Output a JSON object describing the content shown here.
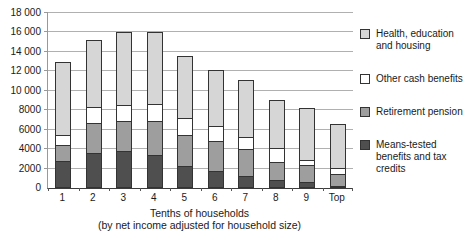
{
  "chart_data": {
    "type": "bar",
    "stacked": true,
    "grid": true,
    "legend_position": "right",
    "categories": [
      "1",
      "2",
      "3",
      "4",
      "5",
      "6",
      "7",
      "8",
      "9",
      "Top"
    ],
    "series": [
      {
        "name": "Means-tested benefits and tax credits",
        "color": "#4f4f4f",
        "values": [
          2800,
          3600,
          3800,
          3400,
          2300,
          1700,
          1200,
          800,
          600,
          200
        ]
      },
      {
        "name": "Retirement pension",
        "color": "#9e9e9e",
        "values": [
          1700,
          3200,
          3200,
          3600,
          3300,
          3200,
          2900,
          2000,
          1900,
          1300
        ]
      },
      {
        "name": "Other cash benefits",
        "color": "#ffffff",
        "values": [
          1200,
          1700,
          1700,
          1800,
          1800,
          1700,
          1400,
          1500,
          600,
          800
        ]
      },
      {
        "name": "Health, education and housing",
        "color": "#d6d6d6",
        "values": [
          7600,
          7000,
          7700,
          7600,
          6500,
          5900,
          5900,
          5100,
          5400,
          4600
        ]
      }
    ],
    "totals": [
      13300,
      15500,
      16400,
      16400,
      13900,
      12500,
      11400,
      9400,
      8500,
      6900
    ],
    "ylim": [
      0,
      18000
    ],
    "yticks": [
      {
        "value": 0,
        "label": "0"
      },
      {
        "value": 2000,
        "label": "2000"
      },
      {
        "value": 4000,
        "label": "4000"
      },
      {
        "value": 6000,
        "label": "6000"
      },
      {
        "value": 8000,
        "label": "8000"
      },
      {
        "value": 10000,
        "label": "10 000"
      },
      {
        "value": 12000,
        "label": "12 000"
      },
      {
        "value": 14000,
        "label": "14 000"
      },
      {
        "value": 16000,
        "label": "16 000"
      },
      {
        "value": 18000,
        "label": "18 000"
      }
    ],
    "xlabel_line1": "Tenths of households",
    "xlabel_line2": "(by net income adjusted for household size)",
    "legend": [
      {
        "lines": [
          "Health, education",
          "and housing"
        ],
        "color": "#d6d6d6",
        "series": "Health, education and housing"
      },
      {
        "lines": [
          "Other cash benefits"
        ],
        "color": "#ffffff",
        "series": "Other cash benefits"
      },
      {
        "lines": [
          "Retirement pension"
        ],
        "color": "#9e9e9e",
        "series": "Retirement pension"
      },
      {
        "lines": [
          "Means-tested",
          "benefits and tax",
          "credits"
        ],
        "color": "#4f4f4f",
        "series": "Means-tested benefits and tax credits"
      }
    ]
  }
}
